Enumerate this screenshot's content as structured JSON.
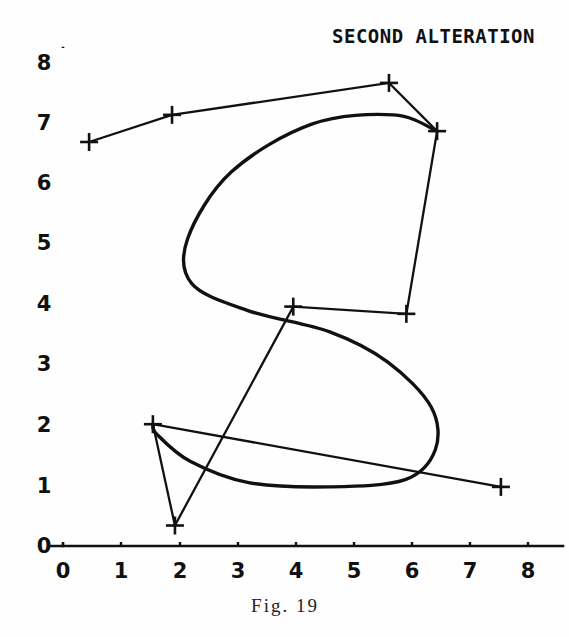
{
  "figure": {
    "title": "SECOND ALTERATION",
    "caption": "Fig. 19",
    "background_color": "#fefefe",
    "ink_color": "#111111"
  },
  "axes": {
    "x_label": "",
    "y_label": "",
    "x_ticks": [
      "0",
      "1",
      "2",
      "3",
      "4",
      "5",
      "6",
      "7",
      "8"
    ],
    "y_ticks": [
      "0",
      "1",
      "2",
      "3",
      "4",
      "5",
      "6",
      "7",
      "8"
    ],
    "origin_label": "0",
    "x_range": [
      0,
      8.7
    ],
    "y_range": [
      0,
      8.5
    ],
    "grid": false
  },
  "chart_data": {
    "type": "line",
    "title": "SECOND ALTERATION",
    "subtitle": "Fig. 19",
    "xlabel": "",
    "ylabel": "",
    "xlim": [
      0,
      8.7
    ],
    "ylim": [
      0,
      8.5
    ],
    "xticks": [
      0,
      1,
      2,
      3,
      4,
      5,
      6,
      7,
      8
    ],
    "yticks": [
      0,
      1,
      2,
      3,
      4,
      5,
      6,
      7,
      8
    ],
    "grid": false,
    "legend": "none",
    "annotations": [
      "SECOND ALTERATION",
      "Fig. 19"
    ],
    "series": [
      {
        "name": "control polygon",
        "style": "thin-open-polyline-with-plus-markers",
        "marker": "plus",
        "x": [
          0.45,
          1.88,
          5.62,
          6.45,
          5.92,
          3.97,
          1.93,
          1.55,
          7.55
        ],
        "y": [
          6.7,
          7.15,
          7.68,
          6.88,
          3.85,
          3.97,
          0.34,
          2.02,
          0.98
        ],
        "vertex_order": [
          {
            "index": 0,
            "x": 0.45,
            "y": 6.7
          },
          {
            "index": 1,
            "x": 1.88,
            "y": 7.15
          },
          {
            "index": 2,
            "x": 5.62,
            "y": 7.68
          },
          {
            "index": 3,
            "x": 6.45,
            "y": 6.88
          },
          {
            "index": 4,
            "x": 5.92,
            "y": 3.85
          },
          {
            "index": 5,
            "x": 3.97,
            "y": 3.97
          },
          {
            "index": 6,
            "x": 1.93,
            "y": 0.34
          },
          {
            "index": 7,
            "x": 1.55,
            "y": 2.02
          },
          {
            "index": 8,
            "x": 7.55,
            "y": 0.98
          }
        ]
      },
      {
        "name": "spline curve",
        "style": "thick-smooth-s-curve",
        "marker": "none",
        "description": "S-shaped B-spline approximating the control polygon",
        "x": [
          6.45,
          5.7,
          4.3,
          2.9,
          2.15,
          2.22,
          3.2,
          4.6,
          5.6,
          6.35,
          6.42,
          5.9,
          4.6,
          3.2,
          2.2,
          1.62,
          1.55
        ],
        "y": [
          6.88,
          7.15,
          7.0,
          6.2,
          5.1,
          4.35,
          3.9,
          3.55,
          3.05,
          2.3,
          1.6,
          1.1,
          0.98,
          1.05,
          1.4,
          1.85,
          2.02
        ]
      }
    ]
  },
  "control_points": [
    {
      "name": "p0",
      "x": 0.45,
      "y": 6.7
    },
    {
      "name": "p1",
      "x": 1.88,
      "y": 7.15
    },
    {
      "name": "p2",
      "x": 5.62,
      "y": 7.68
    },
    {
      "name": "p3",
      "x": 6.45,
      "y": 6.88
    },
    {
      "name": "p4",
      "x": 5.92,
      "y": 3.85
    },
    {
      "name": "p5",
      "x": 3.97,
      "y": 3.97
    },
    {
      "name": "p6",
      "x": 1.93,
      "y": 0.34
    },
    {
      "name": "p7",
      "x": 1.55,
      "y": 2.02
    },
    {
      "name": "p8",
      "x": 7.55,
      "y": 0.98
    }
  ]
}
